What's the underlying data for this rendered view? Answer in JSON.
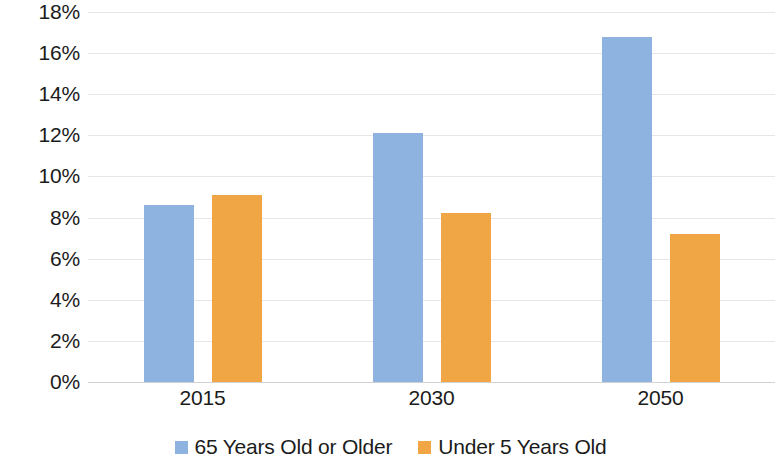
{
  "chart_data": {
    "type": "bar",
    "title": "",
    "subtitle": "",
    "xlabel": "",
    "ylabel": "",
    "categories": [
      "2015",
      "2030",
      "2050"
    ],
    "series": [
      {
        "name": "65 Years Old or Older",
        "color": "#8fb3e0",
        "values": [
          8.6,
          12.1,
          16.8
        ]
      },
      {
        "name": "Under 5 Years Old",
        "color": "#f0a645",
        "values": [
          9.1,
          8.2,
          7.2
        ]
      }
    ],
    "ylim": [
      0,
      18
    ],
    "ytick_values": [
      0,
      2,
      4,
      6,
      8,
      10,
      12,
      14,
      16,
      18
    ],
    "ytick_labels": [
      "0%",
      "2%",
      "4%",
      "6%",
      "8%",
      "10%",
      "12%",
      "14%",
      "16%",
      "18%"
    ],
    "xtick_labels": [
      "2015",
      "2030",
      "2050"
    ],
    "grid": true,
    "grid_axis": "y",
    "grid_color": "#e6e6e6",
    "legend": [
      "65 Years Old or Older",
      "Under 5 Years Old"
    ],
    "legend_position": "bottom",
    "background_color": "#ffffff",
    "text_color": "#1b1b1b",
    "value_unit": "%"
  }
}
